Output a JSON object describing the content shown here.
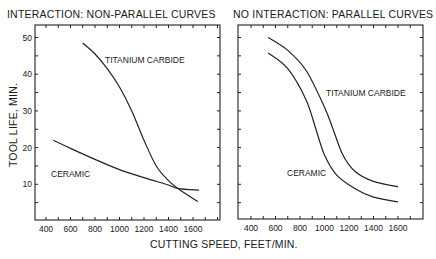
{
  "chart_data": [
    {
      "type": "line",
      "title": "INTERACTION: NON-PARALLEL CURVES",
      "xlabel": "CUTTING SPEED, FEET/MIN.",
      "ylabel": "TOOL LIFE, MIN.",
      "x_ticks": [
        400,
        600,
        800,
        1000,
        1200,
        1400,
        1600
      ],
      "y_ticks": [
        10,
        20,
        30,
        40,
        50
      ],
      "xlim": [
        300,
        1800
      ],
      "ylim": [
        0,
        53
      ],
      "grid": false,
      "legend": "inline labels",
      "series": [
        {
          "name": "TITANIUM CARBIDE",
          "x": [
            700,
            800,
            900,
            1000,
            1100,
            1200,
            1300,
            1400,
            1500,
            1640
          ],
          "y": [
            48.5,
            45.5,
            41.5,
            36.5,
            30,
            22,
            15,
            11,
            8.3,
            5.3
          ]
        },
        {
          "name": "CERAMIC",
          "x": [
            460,
            600,
            800,
            1000,
            1200,
            1400,
            1480,
            1650
          ],
          "y": [
            22,
            19.8,
            16.8,
            14,
            11.8,
            9.8,
            8.8,
            8.4
          ]
        }
      ],
      "annotations": [
        "TITANIUM CARBIDE",
        "CERAMIC"
      ]
    },
    {
      "type": "line",
      "title": "NO INTERACTION: PARALLEL CURVES",
      "xlabel": "CUTTING SPEED, FEET/MIN.",
      "ylabel": "TOOL LIFE, MIN.",
      "x_ticks": [
        400,
        600,
        800,
        1000,
        1200,
        1400,
        1600
      ],
      "y_ticks": [],
      "xlim": [
        300,
        1800
      ],
      "ylim": [
        0,
        53
      ],
      "grid": false,
      "legend": "inline labels",
      "series": [
        {
          "name": "TITANIUM CARBIDE",
          "x": [
            540,
            700,
            850,
            1000,
            1070,
            1150,
            1250,
            1400,
            1600
          ],
          "y": [
            50,
            46.5,
            41,
            31,
            25,
            18,
            13.5,
            10.8,
            9.3
          ]
        },
        {
          "name": "CERAMIC",
          "x": [
            540,
            700,
            850,
            930,
            1000,
            1100,
            1250,
            1400,
            1600
          ],
          "y": [
            45.8,
            41.5,
            33,
            25,
            18,
            12.5,
            8.8,
            6.5,
            5.2
          ]
        }
      ],
      "annotations": [
        "TITANIUM CARBIDE",
        "CERAMIC"
      ]
    }
  ],
  "labels": {
    "left_title": "INTERACTION: NON-PARALLEL CURVES",
    "right_title": "NO INTERACTION: PARALLEL CURVES",
    "xlabel": "CUTTING SPEED, FEET/MIN.",
    "ylabel": "TOOL LIFE, MIN.",
    "tic_label": "TITANIUM CARBIDE",
    "ceramic_label": "CERAMIC"
  }
}
